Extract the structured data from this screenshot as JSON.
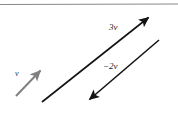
{
  "figure": {
    "background_color": "#ffffff",
    "top_rule": {
      "name": "horizontal-rule",
      "color": "#8a8a8a",
      "y": 4,
      "x_start": 0,
      "x_end": 178,
      "thickness": 1.2
    },
    "vectors": [
      {
        "id": "v",
        "label": "v",
        "color": "#808080",
        "stroke_width": 2.0,
        "x1": 16,
        "y1": 96,
        "x2": 43,
        "y2": 68,
        "arrowhead": "end",
        "label_x": 15,
        "label_y": 70,
        "description": "base vector v, gray, pointing up and to the right"
      },
      {
        "id": "3v",
        "label": "3v",
        "color": "#141414",
        "stroke_width": 1.6,
        "x1": 42,
        "y1": 102,
        "x2": 153,
        "y2": 13,
        "arrowhead": "end",
        "label_x": 109,
        "label_y": 23,
        "description": "vector 3v, black, three times length of v, same direction"
      },
      {
        "id": "-2v",
        "label": "−2v",
        "color": "#141414",
        "stroke_width": 1.6,
        "x1": 159,
        "y1": 40,
        "x2": 85,
        "y2": 103,
        "arrowhead": "end",
        "label_x": 103,
        "label_y": 62,
        "description": "vector minus 2v, black, twice length of v, opposite direction pointing down-left"
      }
    ]
  }
}
